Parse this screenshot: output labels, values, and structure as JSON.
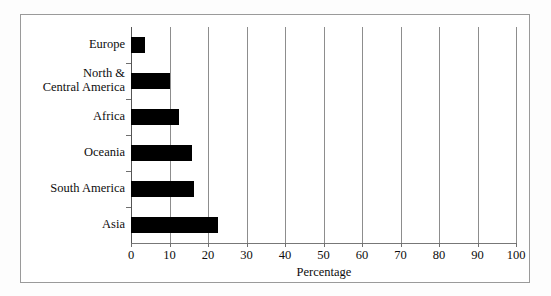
{
  "chart_data": {
    "type": "bar",
    "orientation": "horizontal",
    "title": "",
    "xlabel": "Percentage",
    "ylabel": "",
    "categories": [
      "Europe",
      "North &\nCentral America",
      "Africa",
      "Oceania",
      "South America",
      "Asia"
    ],
    "values": [
      3.6,
      10.0,
      12.5,
      15.8,
      16.4,
      22.7
    ],
    "xlim": [
      0,
      100
    ],
    "xticks": [
      0,
      10,
      20,
      30,
      40,
      50,
      60,
      70,
      80,
      90,
      100
    ],
    "xticklabels": [
      "0",
      "10",
      "20",
      "30",
      "40",
      "50",
      "60",
      "70",
      "80",
      "90",
      "100"
    ],
    "grid": "vertical",
    "legend": "none",
    "bar_color": "#000000",
    "frame_color": "#9a9a9a",
    "gridline_color": "#8d8d8d",
    "background": "#ffffff"
  }
}
